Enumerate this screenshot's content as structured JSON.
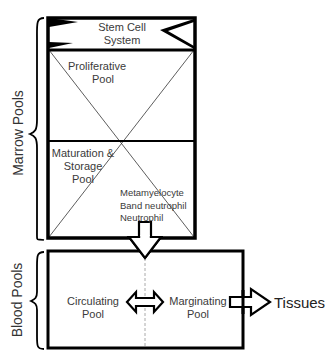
{
  "diagram": {
    "marrow": {
      "group_label": "Marrow Pools",
      "stem_cell": {
        "label": "Stem Cell\nSystem",
        "line1": "Stem Cell",
        "line2": "System"
      },
      "proliferative": {
        "line1": "Proliferative",
        "line2": "Pool"
      },
      "maturation": {
        "line1": "Maturation &",
        "line2": "Storage",
        "line3": "Pool"
      },
      "cell_types": [
        "Metamyelocyte",
        "Band neutrophil",
        "Neutrophil"
      ]
    },
    "blood": {
      "group_label": "Blood Pools",
      "circulating": {
        "line1": "Circulating",
        "line2": "Pool"
      },
      "marginating": {
        "line1": "Marginating",
        "line2": "Pool"
      }
    },
    "destination": {
      "label": "Tissues"
    },
    "arrows": [
      {
        "from": "Marrow Pools",
        "to": "Blood Pools",
        "type": "single"
      },
      {
        "from": "Circulating Pool",
        "to": "Marginating Pool",
        "type": "double"
      },
      {
        "from": "Marginating Pool",
        "to": "Tissues",
        "type": "single"
      }
    ],
    "colors": {
      "stroke": "#000000",
      "text": "#3a3a3a",
      "divider": "#aaaaaa"
    }
  }
}
